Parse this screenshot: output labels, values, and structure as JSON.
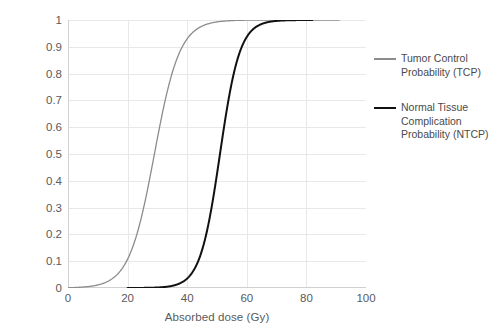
{
  "chart_data": {
    "type": "line",
    "title": "",
    "xlabel": "Absorbed dose (Gy)",
    "ylabel": "Probability of outcome",
    "xlim": [
      0,
      100
    ],
    "ylim": [
      0,
      1
    ],
    "xticks": [
      "0",
      "20",
      "40",
      "60",
      "80",
      "100"
    ],
    "xtick_values": [
      0,
      20,
      40,
      60,
      80,
      100
    ],
    "yticks": [
      "0",
      "0.1",
      "0.2",
      "0.3",
      "0.4",
      "0.5",
      "0.6",
      "0.7",
      "0.8",
      "0.9",
      "1"
    ],
    "ytick_values": [
      0,
      0.1,
      0.2,
      0.3,
      0.4,
      0.5,
      0.6,
      0.7,
      0.8,
      0.9,
      1
    ],
    "grid": "both-light",
    "legend_position": "right",
    "series": [
      {
        "name": "Tumor Control Probability (TCP)",
        "short_name": "TCP",
        "color": "#8c8c8c",
        "width": 1.3,
        "d50": 29,
        "slope_k": 0.235,
        "x_start": 0,
        "x_end": 91,
        "x": [
          0,
          5,
          10,
          12,
          14,
          16,
          18,
          20,
          22,
          24,
          26,
          28,
          29,
          30,
          32,
          34,
          36,
          38,
          40,
          42,
          44,
          46,
          50,
          55,
          60,
          70,
          80,
          91
        ],
        "values": [
          0.001,
          0.003,
          0.01,
          0.016,
          0.025,
          0.04,
          0.062,
          0.096,
          0.145,
          0.213,
          0.301,
          0.407,
          0.463,
          0.52,
          0.63,
          0.729,
          0.809,
          0.87,
          0.914,
          0.944,
          0.964,
          0.978,
          0.992,
          0.997,
          0.999,
          1.0,
          1.0,
          1.0
        ]
      },
      {
        "name": "Normal Tissue Complication Probability (NTCP)",
        "short_name": "NTCP",
        "color": "#111111",
        "width": 2.0,
        "d50": 51,
        "slope_k": 0.3,
        "x_start": 20,
        "x_end": 82,
        "x": [
          20,
          25,
          30,
          33,
          35,
          37,
          39,
          41,
          43,
          45,
          47,
          49,
          51,
          53,
          55,
          57,
          59,
          61,
          63,
          65,
          67,
          70,
          75,
          82
        ],
        "values": [
          0.0001,
          0.0004,
          0.0012,
          0.003,
          0.0055,
          0.01,
          0.018,
          0.032,
          0.057,
          0.099,
          0.166,
          0.265,
          0.395,
          0.545,
          0.688,
          0.801,
          0.88,
          0.931,
          0.961,
          0.978,
          0.988,
          0.996,
          0.999,
          1.0
        ]
      }
    ]
  },
  "axes": {
    "x_title": "Absorbed dose (Gy)",
    "y_title": "Probability of outcome",
    "x_tick_labels": [
      "0",
      "20",
      "40",
      "60",
      "80",
      "100"
    ],
    "y_tick_labels": [
      "1",
      "0.9",
      "0.8",
      "0.7",
      "0.6",
      "0.5",
      "0.4",
      "0.3",
      "0.2",
      "0.1",
      "0"
    ]
  },
  "legend": {
    "entries": [
      {
        "label": "Tumor Control Probability (TCP)",
        "color": "#8c8c8c"
      },
      {
        "label": "Normal Tissue Complication Probability (NTCP)",
        "color": "#111111"
      }
    ]
  },
  "colors": {
    "tcp_line": "#8c8c8c",
    "ntcp_line": "#111111",
    "grid": "#e8e8e8",
    "axis": "#d0d0d0",
    "text": "#5a5a5a"
  }
}
